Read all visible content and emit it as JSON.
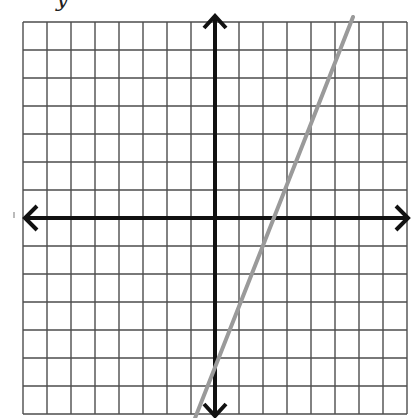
{
  "header": {
    "label_fragment": "        y"
  },
  "graph": {
    "pixel_origin": [
      215,
      218
    ],
    "unit_px": {
      "x": 24,
      "y": 28
    },
    "x_range": [
      -8,
      8
    ],
    "y_range": [
      -7,
      7
    ],
    "grid_color": "#4d4d4d",
    "axis_color": "#111111",
    "line_color": "#9a9a9a",
    "background": "#ffffff"
  },
  "chart_data": {
    "type": "line",
    "title": "",
    "xlabel": "",
    "ylabel": "",
    "grid": true,
    "xlim": [
      -8,
      8
    ],
    "ylim": [
      -7,
      7
    ],
    "tick_labels": "none",
    "series": [
      {
        "name": "graphed line",
        "equation_estimate": "y = 2x - 5",
        "x": [
          -0.83,
          5.75
        ],
        "y": [
          -7.14,
          7.18
        ],
        "color": "#9a9a9a"
      }
    ],
    "axes": {
      "x_axis": "horizontal double-arrow at y=0",
      "y_axis": "vertical double-arrow at x=0"
    }
  }
}
